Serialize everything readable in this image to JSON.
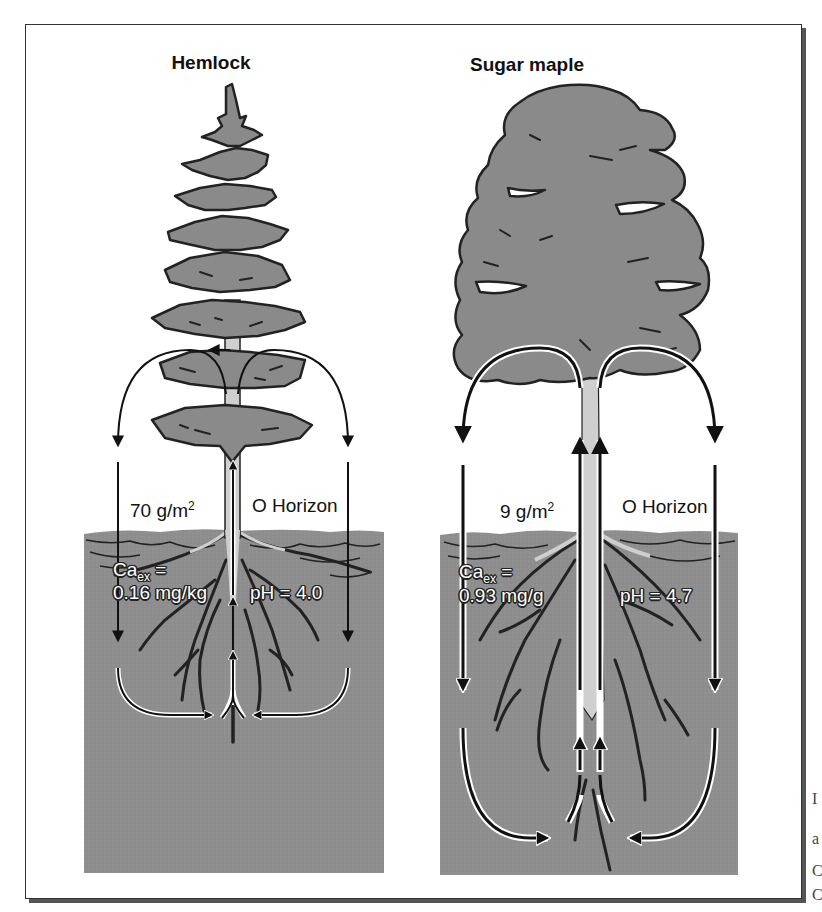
{
  "figure": {
    "panels": [
      {
        "title": "Hemlock",
        "litterfall_label": "70 g/m",
        "litterfall_unit_sup": "2",
        "horizon_label": "O Horizon",
        "ca_label": "Ca",
        "ca_sub": "ex",
        "ca_equals": " =",
        "ca_value": "0.16 mg/kg",
        "ph_label": "pH = 4.0"
      },
      {
        "title": "Sugar maple",
        "litterfall_label": "9 g/m",
        "litterfall_unit_sup": "2",
        "horizon_label": "O Horizon",
        "ca_label": "Ca",
        "ca_sub": "ex",
        "ca_equals": " =",
        "ca_value": "0.93 mg/g",
        "ph_label": "pH = 4.7"
      }
    ],
    "colors": {
      "foliage": "#8a8a8a",
      "soil": "#8e8e8e",
      "trunk": "#cfcfcf",
      "outline": "#222222",
      "frame": "#333333"
    }
  },
  "edge_bleed_text": [
    "I",
    "a",
    "C",
    "C"
  ]
}
